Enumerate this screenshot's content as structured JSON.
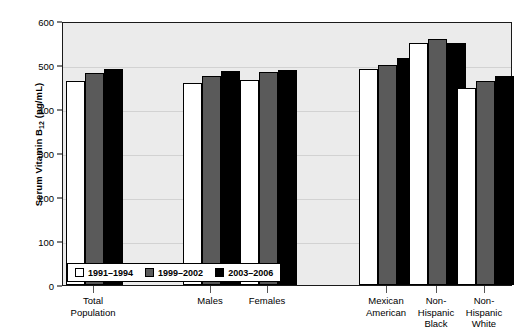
{
  "chart_data": {
    "type": "bar",
    "title": "",
    "subtitle": "",
    "xlabel": "",
    "ylabel": "Serum Vitamin B12 (pg/mL)",
    "ylabel_parts": {
      "main": "Serum Vitamin B",
      "sub": "12",
      "units": " (pg/mL)"
    },
    "ylim": [
      0,
      600
    ],
    "ytick_step": 100,
    "yticks": [
      0,
      100,
      200,
      300,
      400,
      500,
      600
    ],
    "ytick_labels": [
      "0",
      "100",
      "200",
      "300",
      "400",
      "500",
      "600"
    ],
    "grid": true,
    "grid_axis": "y",
    "legend_position": "bottom-left-inside",
    "categories": [
      "Total Population",
      "Males",
      "Females",
      "Mexican American",
      "Non-Hispanic Black",
      "Non-Hispanic White"
    ],
    "category_label_lines": [
      [
        "Total",
        "Population"
      ],
      [
        "Males"
      ],
      [
        "Females"
      ],
      [
        "Mexican",
        "American"
      ],
      [
        "Non-",
        "Hispanic",
        "Black"
      ],
      [
        "Non-",
        "Hispanic",
        "White"
      ]
    ],
    "series": [
      {
        "name": "1991–1994",
        "color": "#ffffff",
        "values": [
          463,
          458,
          466,
          490,
          549,
          448
        ]
      },
      {
        "name": "1999–2002",
        "color": "#5a5a5a",
        "values": [
          481,
          475,
          483,
          500,
          560,
          464
        ]
      },
      {
        "name": "2003–2006",
        "color": "#000000",
        "values": [
          491,
          487,
          489,
          515,
          549,
          474
        ]
      }
    ],
    "colors": {
      "plot_background": "#ebebeb",
      "axis": "#1a1a1a",
      "gridline": "#d2d2d2",
      "text": "#000000"
    }
  },
  "legend": {
    "items": [
      {
        "label": "1991–1994",
        "swatch": "white-swatch"
      },
      {
        "label": "1999–2002",
        "swatch": "gray-swatch"
      },
      {
        "label": "2003–2006",
        "swatch": "black-swatch"
      }
    ]
  }
}
